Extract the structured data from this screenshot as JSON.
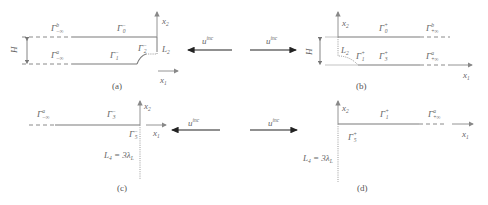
{
  "figure": {
    "panels": [
      {
        "id": "a",
        "caption": "(a)",
        "labels": {
          "top_far": "Γ",
          "top_far_sup": "b",
          "top_far_sub": "−∞",
          "bottom_far": "Γ",
          "bottom_far_sup": "a",
          "bottom_far_sub": "−∞",
          "top_near": "Γ",
          "top_near_sup": "−",
          "top_near_sub": "0",
          "bottom_near": "Γ",
          "bottom_near_sup": "−",
          "bottom_near_sub": "1",
          "step": "Γ",
          "step_sup": "−",
          "step_sub": "2",
          "height": "H",
          "end_segment": "L",
          "end_segment_sub": "2",
          "axis_x1": "x",
          "axis_x1_sub": "1",
          "axis_x2": "x",
          "axis_x2_sub": "2"
        }
      },
      {
        "id": "b",
        "caption": "(b)",
        "labels": {
          "top_near": "Γ",
          "top_near_sup": "+",
          "top_near_sub": "0",
          "top_far": "Γ",
          "top_far_sup": "b",
          "top_far_sub": "+∞",
          "bottom_step": "Γ",
          "bottom_step_sup": "+",
          "bottom_step_sub": "1",
          "bottom_near": "Γ",
          "bottom_near_sup": "+",
          "bottom_near_sub": "3",
          "bottom_far": "Γ",
          "bottom_far_sup": "a",
          "bottom_far_sub": "+∞",
          "height": "H",
          "end_segment": "L",
          "end_segment_sub": "2",
          "axis_x1": "x",
          "axis_x1_sub": "1",
          "axis_x2": "x",
          "axis_x2_sub": "2"
        }
      },
      {
        "id": "c",
        "caption": "(c)",
        "labels": {
          "far": "Γ",
          "far_sup": "a",
          "far_sub": "−∞",
          "near": "Γ",
          "near_sup": "−",
          "near_sub": "3",
          "vertical": "Γ",
          "vertical_sup": "−",
          "vertical_sub": "5",
          "length_eq": "L",
          "length_eq_sub": "4",
          "length_rhs": " = 3λ",
          "length_rhs_sub": "L",
          "axis_x1": "x",
          "axis_x1_sub": "1",
          "axis_x2": "x",
          "axis_x2_sub": "2"
        }
      },
      {
        "id": "d",
        "caption": "(d)",
        "labels": {
          "near": "Γ",
          "near_sup": "+",
          "near_sub": "1",
          "far": "Γ",
          "far_sup": "a",
          "far_sub": "+∞",
          "vertical": "Γ",
          "vertical_sup": "+",
          "vertical_sub": "5",
          "length_eq": "L",
          "length_eq_sub": "4",
          "length_rhs": " = 3λ",
          "length_rhs_sub": "L",
          "axis_x1": "x",
          "axis_x1_sub": "1",
          "axis_x2": "x",
          "axis_x2_sub": "2"
        }
      }
    ],
    "incident_waves": [
      {
        "label": "u",
        "label_sup": "inc",
        "direction": "left",
        "row": "top"
      },
      {
        "label": "u",
        "label_sup": "inc",
        "direction": "right",
        "row": "top"
      },
      {
        "label": "u",
        "label_sup": "inc",
        "direction": "left",
        "row": "bottom"
      },
      {
        "label": "u",
        "label_sup": "inc",
        "direction": "right",
        "row": "bottom"
      }
    ],
    "colors": {
      "solid_line": "#7a7a7a",
      "dashed_line": "#8a8a8a",
      "arrow": "#333333",
      "axis": "#777777",
      "text": "#666666"
    }
  }
}
